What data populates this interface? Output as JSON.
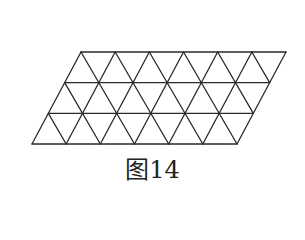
{
  "figure": {
    "caption": "图14",
    "shape": "parallelogram",
    "rows": 3,
    "columns": 6,
    "unit_triangles": 36,
    "stroke_color": "#2a2a2a",
    "geometry": {
      "top_left": [
        81,
        52
      ],
      "top_right": [
        286,
        52
      ],
      "bottom_left": [
        32,
        144
      ],
      "bottom_right": [
        237,
        144
      ],
      "row_lines_y": [
        52,
        83,
        113,
        144
      ]
    }
  }
}
